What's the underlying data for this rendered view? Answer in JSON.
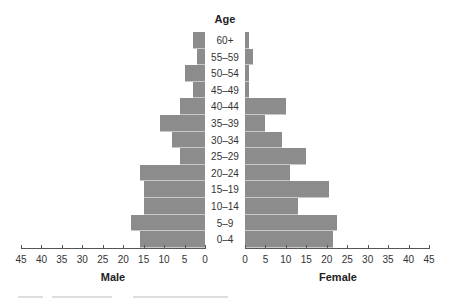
{
  "chart_data": {
    "type": "bar",
    "subtype": "population-pyramid",
    "title": "Age",
    "categories": [
      "60+",
      "55–59",
      "50–54",
      "45–49",
      "40–44",
      "35–39",
      "30–34",
      "25–29",
      "20–24",
      "15–19",
      "10–14",
      "5–9",
      "0–4"
    ],
    "series": [
      {
        "name": "Male",
        "values": [
          3,
          2,
          5,
          3,
          6,
          11,
          8,
          6,
          16,
          15,
          15,
          18,
          16
        ]
      },
      {
        "name": "Female",
        "values": [
          1,
          2,
          1,
          1,
          10,
          5,
          9,
          15,
          11,
          20.5,
          13,
          22.5,
          21.5
        ]
      }
    ],
    "xlabel_left": "Male",
    "xlabel_right": "Female",
    "ylabel": "Age",
    "xlim": [
      0,
      45
    ],
    "xticks": [
      0,
      5,
      10,
      15,
      20,
      25,
      30,
      35,
      40,
      45
    ],
    "bar_color": "#8c8c8c",
    "grid": false,
    "legend": "none"
  },
  "labels": {
    "title": "Age",
    "male": "Male",
    "female": "Female"
  }
}
